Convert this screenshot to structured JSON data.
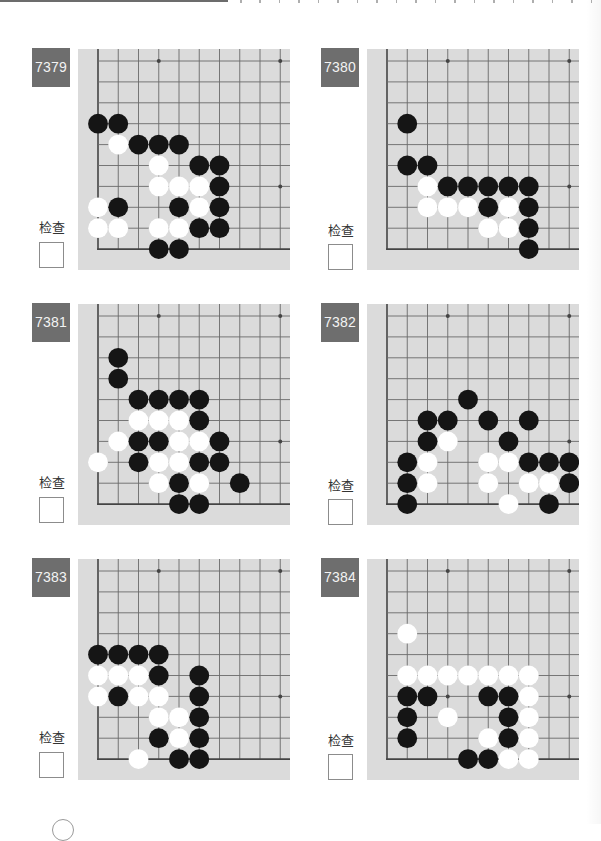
{
  "board_view": {
    "visible_columns": 10,
    "visible_rows": 10,
    "corner": "bottom-left",
    "star_points": [
      [
        3,
        0
      ],
      [
        9,
        0
      ],
      [
        3,
        6
      ],
      [
        9,
        6
      ]
    ]
  },
  "colors": {
    "label_bg": "#6e6e6e",
    "board_bg": "#dbdbdb",
    "black_stone": "#151515",
    "white_stone": "#ffffff",
    "grid_line": "#6a6a6a",
    "edge_line": "#444444"
  },
  "problems": [
    {
      "number": "7379",
      "check_label": "检查",
      "checked": false,
      "stones": {
        "black": [
          [
            0,
            3
          ],
          [
            1,
            3
          ],
          [
            2,
            4
          ],
          [
            3,
            4
          ],
          [
            4,
            4
          ],
          [
            5,
            5
          ],
          [
            6,
            5
          ],
          [
            6,
            6
          ],
          [
            1,
            7
          ],
          [
            4,
            7
          ],
          [
            6,
            7
          ],
          [
            5,
            8
          ],
          [
            6,
            8
          ],
          [
            3,
            9
          ],
          [
            4,
            9
          ]
        ],
        "white": [
          [
            1,
            4
          ],
          [
            3,
            5
          ],
          [
            3,
            6
          ],
          [
            4,
            6
          ],
          [
            5,
            6
          ],
          [
            0,
            7
          ],
          [
            5,
            7
          ],
          [
            0,
            8
          ],
          [
            1,
            8
          ],
          [
            3,
            8
          ],
          [
            4,
            8
          ]
        ]
      }
    },
    {
      "number": "7380",
      "check_label": "检查",
      "checked": false,
      "stones": {
        "black": [
          [
            1,
            3
          ],
          [
            1,
            5
          ],
          [
            2,
            5
          ],
          [
            3,
            6
          ],
          [
            4,
            6
          ],
          [
            5,
            6
          ],
          [
            6,
            6
          ],
          [
            7,
            6
          ],
          [
            5,
            7
          ],
          [
            7,
            7
          ],
          [
            7,
            8
          ],
          [
            7,
            9
          ]
        ],
        "white": [
          [
            2,
            6
          ],
          [
            2,
            7
          ],
          [
            3,
            7
          ],
          [
            4,
            7
          ],
          [
            6,
            7
          ],
          [
            5,
            8
          ],
          [
            6,
            8
          ]
        ]
      }
    },
    {
      "number": "7381",
      "check_label": "检查",
      "checked": false,
      "stones": {
        "black": [
          [
            1,
            2
          ],
          [
            1,
            3
          ],
          [
            2,
            4
          ],
          [
            3,
            4
          ],
          [
            4,
            4
          ],
          [
            5,
            4
          ],
          [
            5,
            5
          ],
          [
            2,
            6
          ],
          [
            3,
            6
          ],
          [
            6,
            6
          ],
          [
            2,
            7
          ],
          [
            5,
            7
          ],
          [
            6,
            7
          ],
          [
            4,
            8
          ],
          [
            7,
            8
          ],
          [
            4,
            9
          ],
          [
            5,
            9
          ]
        ],
        "white": [
          [
            2,
            5
          ],
          [
            3,
            5
          ],
          [
            4,
            5
          ],
          [
            1,
            6
          ],
          [
            4,
            6
          ],
          [
            5,
            6
          ],
          [
            0,
            7
          ],
          [
            3,
            7
          ],
          [
            4,
            7
          ],
          [
            3,
            8
          ],
          [
            5,
            8
          ]
        ]
      }
    },
    {
      "number": "7382",
      "check_label": "检查",
      "checked": false,
      "stones": {
        "black": [
          [
            4,
            4
          ],
          [
            2,
            5
          ],
          [
            3,
            5
          ],
          [
            5,
            5
          ],
          [
            7,
            5
          ],
          [
            2,
            6
          ],
          [
            6,
            6
          ],
          [
            1,
            7
          ],
          [
            7,
            7
          ],
          [
            8,
            7
          ],
          [
            9,
            7
          ],
          [
            1,
            8
          ],
          [
            9,
            8
          ],
          [
            1,
            9
          ],
          [
            8,
            9
          ]
        ],
        "white": [
          [
            3,
            6
          ],
          [
            2,
            7
          ],
          [
            5,
            7
          ],
          [
            6,
            7
          ],
          [
            2,
            8
          ],
          [
            5,
            8
          ],
          [
            7,
            8
          ],
          [
            8,
            8
          ],
          [
            6,
            9
          ]
        ]
      }
    },
    {
      "number": "7383",
      "check_label": "检查",
      "checked": false,
      "stones": {
        "black": [
          [
            0,
            4
          ],
          [
            1,
            4
          ],
          [
            2,
            4
          ],
          [
            3,
            4
          ],
          [
            3,
            5
          ],
          [
            5,
            5
          ],
          [
            1,
            6
          ],
          [
            5,
            6
          ],
          [
            5,
            7
          ],
          [
            3,
            8
          ],
          [
            5,
            8
          ],
          [
            4,
            9
          ],
          [
            5,
            9
          ]
        ],
        "white": [
          [
            0,
            5
          ],
          [
            1,
            5
          ],
          [
            2,
            5
          ],
          [
            0,
            6
          ],
          [
            2,
            6
          ],
          [
            3,
            6
          ],
          [
            3,
            7
          ],
          [
            4,
            7
          ],
          [
            4,
            8
          ],
          [
            2,
            9
          ]
        ]
      }
    },
    {
      "number": "7384",
      "check_label": "检查",
      "checked": false,
      "stones": {
        "black": [
          [
            1,
            6
          ],
          [
            2,
            6
          ],
          [
            5,
            6
          ],
          [
            6,
            6
          ],
          [
            1,
            7
          ],
          [
            6,
            7
          ],
          [
            1,
            8
          ],
          [
            6,
            8
          ],
          [
            4,
            9
          ],
          [
            5,
            9
          ]
        ],
        "white": [
          [
            1,
            3
          ],
          [
            1,
            5
          ],
          [
            2,
            5
          ],
          [
            3,
            5
          ],
          [
            4,
            5
          ],
          [
            5,
            5
          ],
          [
            6,
            5
          ],
          [
            7,
            5
          ],
          [
            7,
            6
          ],
          [
            3,
            7
          ],
          [
            7,
            7
          ],
          [
            5,
            8
          ],
          [
            7,
            8
          ],
          [
            6,
            9
          ],
          [
            7,
            9
          ]
        ]
      }
    }
  ]
}
